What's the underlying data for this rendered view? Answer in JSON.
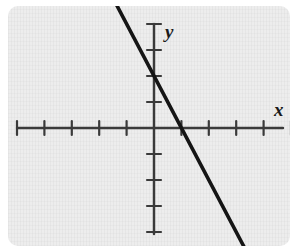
{
  "figure": {
    "title": "",
    "panel_background_color": "#ececec",
    "page_background_color": "#ffffff",
    "axis_color": "#3a3a3a",
    "line_color": "#151515"
  },
  "labels": {
    "x_axis": "x",
    "y_axis": "y"
  },
  "chart_data": {
    "type": "line",
    "title": "",
    "xlabel": "x",
    "ylabel": "y",
    "grid": false,
    "legend": "none",
    "xlim": [
      -5,
      5
    ],
    "ylim": [
      -5,
      4
    ],
    "x_ticks": [
      -5,
      -4,
      -3,
      -2,
      -1,
      1,
      2,
      3,
      4,
      5
    ],
    "y_ticks": [
      -5,
      -4,
      -3,
      -2,
      -1,
      1,
      2,
      3,
      4
    ],
    "tick_labels_shown": false,
    "series": [
      {
        "name": "line",
        "slope": -2,
        "y_intercept": 2,
        "x_intercept": 1,
        "equation": "y = -2x + 2",
        "x": [
          -1.6,
          4.2
        ],
        "y": [
          5.2,
          -6.4
        ],
        "endpoints": [
          {
            "x": -1.6,
            "y": 5.2
          },
          {
            "x": 4.2,
            "y": -6.4
          }
        ]
      }
    ]
  }
}
